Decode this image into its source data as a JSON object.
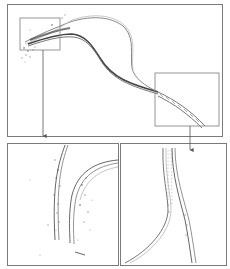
{
  "figure": {
    "type": "trajectory-overview-with-zoom-insets",
    "panels": [
      {
        "id": "overview",
        "label": ""
      },
      {
        "id": "zoom-left",
        "label": ""
      },
      {
        "id": "zoom-right",
        "label": ""
      }
    ],
    "colors": {
      "border": "#7a7a7a",
      "inset_box": "#8a8a8a",
      "track_dark": "#333333",
      "track_light": "#9a9a9a",
      "scatter": "#555555"
    }
  }
}
